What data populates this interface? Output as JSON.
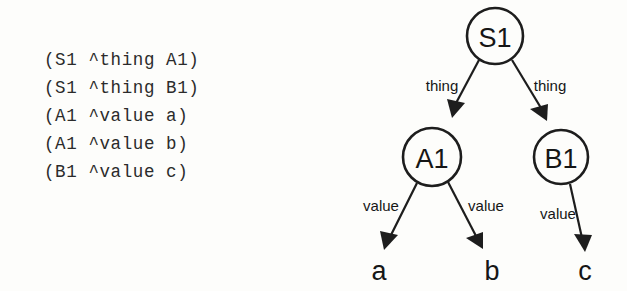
{
  "figure": {
    "background_color": "#fdfdfb",
    "ink_color": "#1d1d1d"
  },
  "wm_listing": {
    "lines": [
      "(S1 ^thing A1)",
      "(S1 ^thing B1)",
      "(A1 ^value a)",
      "(A1 ^value b)",
      "(B1 ^value c)"
    ]
  },
  "graph": {
    "nodes": [
      {
        "id": "S1",
        "label": "S1",
        "shape": "circle"
      },
      {
        "id": "A1",
        "label": "A1",
        "shape": "circle"
      },
      {
        "id": "B1",
        "label": "B1",
        "shape": "circle"
      },
      {
        "id": "a",
        "label": "a",
        "shape": "leaf"
      },
      {
        "id": "b",
        "label": "b",
        "shape": "leaf"
      },
      {
        "id": "c",
        "label": "c",
        "shape": "leaf"
      }
    ],
    "edges": [
      {
        "from": "S1",
        "to": "A1",
        "label": "thing"
      },
      {
        "from": "S1",
        "to": "B1",
        "label": "thing"
      },
      {
        "from": "A1",
        "to": "a",
        "label": "value"
      },
      {
        "from": "A1",
        "to": "b",
        "label": "value"
      },
      {
        "from": "B1",
        "to": "c",
        "label": "value"
      }
    ]
  }
}
